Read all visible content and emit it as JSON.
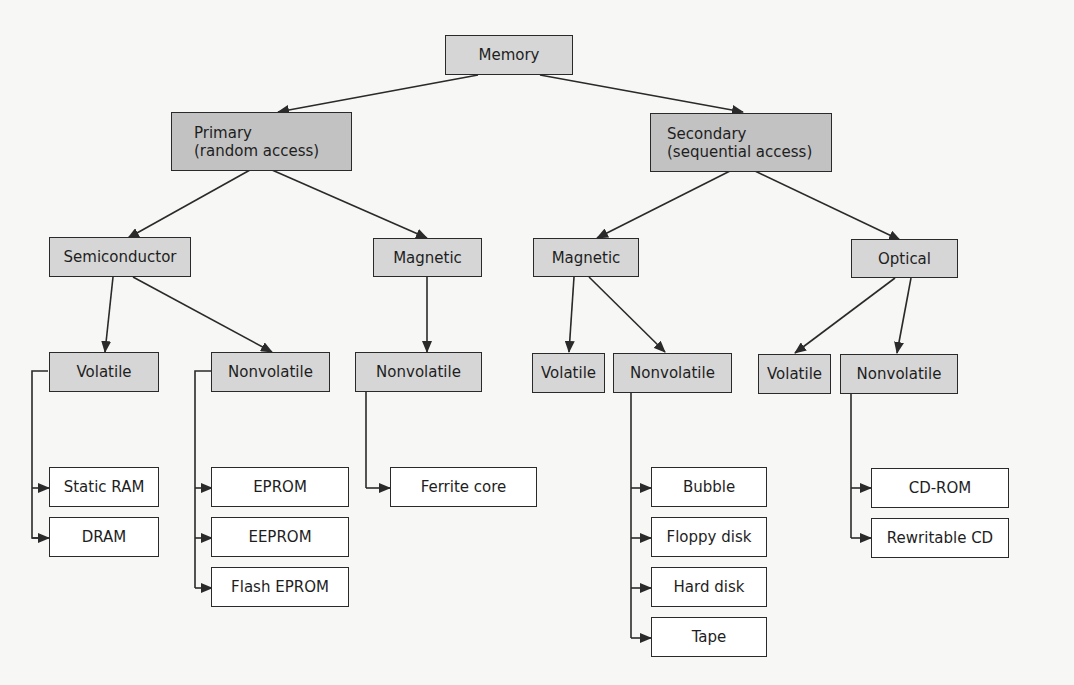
{
  "diagram": {
    "colors": {
      "background": "#f7f7f5",
      "root_fill": "#d6d6d6",
      "level1_fill": "#c2c2c2",
      "category_fill": "#d6d6d6",
      "leaf_fill": "#ffffff",
      "line": "#2a2a2a"
    },
    "root": {
      "label": "Memory"
    },
    "primary": {
      "line1": "Primary",
      "line2": "(random access)",
      "semiconductor": {
        "label": "Semiconductor",
        "volatile": {
          "label": "Volatile",
          "items": [
            "Static RAM",
            "DRAM"
          ]
        },
        "nonvolatile": {
          "label": "Nonvolatile",
          "items": [
            "EPROM",
            "EEPROM",
            "Flash EPROM"
          ]
        }
      },
      "magnetic": {
        "label": "Magnetic",
        "nonvolatile": {
          "label": "Nonvolatile",
          "items": [
            "Ferrite core"
          ]
        }
      }
    },
    "secondary": {
      "line1": "Secondary",
      "line2": "(sequential access)",
      "magnetic": {
        "label": "Magnetic",
        "volatile": {
          "label": "Volatile"
        },
        "nonvolatile": {
          "label": "Nonvolatile",
          "items": [
            "Bubble",
            "Floppy disk",
            "Hard disk",
            "Tape"
          ]
        }
      },
      "optical": {
        "label": "Optical",
        "volatile": {
          "label": "Volatile"
        },
        "nonvolatile": {
          "label": "Nonvolatile",
          "items": [
            "CD-ROM",
            "Rewritable CD"
          ]
        }
      }
    }
  }
}
